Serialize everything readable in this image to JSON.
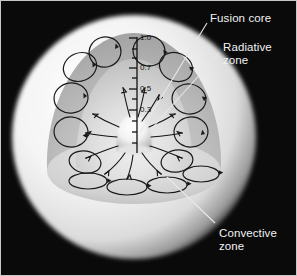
{
  "figure": {
    "background_color": "#0a0a0a",
    "border_color": "#c8c8c8",
    "label_color": "#f2f2f2",
    "leader_color": "#e8e8e8"
  },
  "labels": [
    {
      "id": "fusion-core",
      "text": "Fusion core",
      "x": 209,
      "y": 11
    },
    {
      "id": "radiative-zone",
      "text": "Radiative\nzone",
      "x": 222,
      "y": 40
    },
    {
      "id": "convective-zone",
      "text": "Convective\nzone",
      "x": 218,
      "y": 226
    }
  ],
  "leader_lines": [
    {
      "id": "leader-fusion-core",
      "x1": 206,
      "y1": 22,
      "x2": 139,
      "y2": 131
    },
    {
      "id": "leader-radiative-zone",
      "x1": 218,
      "y1": 52,
      "x2": 152,
      "y2": 126
    },
    {
      "id": "leader-convective-zone",
      "x1": 214,
      "y1": 222,
      "x2": 166,
      "y2": 176
    }
  ],
  "scale": {
    "name": "fractional-solar-radius-scale",
    "axis_x": 136,
    "axis_top_y": 36,
    "axis_bottom_y": 152,
    "unit_note": "fraction of solar radius",
    "ticks": [
      {
        "value": "1.0",
        "y": 37,
        "major": true
      },
      {
        "value": "",
        "y": 48,
        "major": false
      },
      {
        "value": "",
        "y": 57,
        "major": false
      },
      {
        "value": "0.7",
        "y": 67,
        "major": true
      },
      {
        "value": "",
        "y": 77,
        "major": false
      },
      {
        "value": "0.5",
        "y": 88,
        "major": true
      },
      {
        "value": "",
        "y": 98,
        "major": false
      },
      {
        "value": "0.3",
        "y": 109,
        "major": true
      },
      {
        "value": "",
        "y": 120,
        "major": false
      },
      {
        "value": "",
        "y": 131,
        "major": false
      },
      {
        "value": "",
        "y": 142,
        "major": false
      }
    ]
  },
  "regions": [
    {
      "id": "photosphere-sphere",
      "name": "outer solar sphere",
      "color": "#efefef"
    },
    {
      "id": "convective-zone-wedge",
      "name": "convective zone cutaway",
      "color": "#b9b9b9"
    },
    {
      "id": "radiative-zone-wedge",
      "name": "radiative zone cutaway",
      "color": "#d4d4d4"
    },
    {
      "id": "fusion-core-dome",
      "name": "fusion core",
      "color": "#f6f6f6"
    }
  ],
  "convection_cells": {
    "count": 14,
    "stroke": "#1a1a1a",
    "face_wall": [
      {
        "cx": 79,
        "cy": 66,
        "rx": 17,
        "ry": 14,
        "rot": -22
      },
      {
        "cx": 70,
        "cy": 97,
        "rx": 17,
        "ry": 15,
        "rot": -8
      },
      {
        "cx": 70,
        "cy": 131,
        "rx": 17,
        "ry": 15,
        "rot": 6
      },
      {
        "cx": 104,
        "cy": 51,
        "rx": 16,
        "ry": 15,
        "rot": -18
      },
      {
        "cx": 148,
        "cy": 50,
        "rx": 16,
        "ry": 15,
        "rot": 14
      },
      {
        "cx": 175,
        "cy": 66,
        "rx": 17,
        "ry": 14,
        "rot": 24
      },
      {
        "cx": 188,
        "cy": 98,
        "rx": 17,
        "ry": 15,
        "rot": 10
      },
      {
        "cx": 190,
        "cy": 131,
        "rx": 17,
        "ry": 15,
        "rot": -6
      },
      {
        "cx": 176,
        "cy": 160,
        "rx": 16,
        "ry": 11,
        "rot": -10
      },
      {
        "cx": 84,
        "cy": 161,
        "rx": 16,
        "ry": 11,
        "rot": 10
      }
    ],
    "floor_plane": [
      {
        "cx": 87,
        "cy": 180,
        "rx": 19,
        "ry": 8,
        "rot": 0
      },
      {
        "cx": 126,
        "cy": 186,
        "rx": 20,
        "ry": 8,
        "rot": 0
      },
      {
        "cx": 166,
        "cy": 184,
        "rx": 20,
        "ry": 8,
        "rot": 0
      },
      {
        "cx": 200,
        "cy": 173,
        "rx": 18,
        "ry": 8,
        "rot": 0
      }
    ]
  },
  "radiation_arrows": {
    "count": 12,
    "stroke": "#141414",
    "description": "wavy arrows radiating outward from the fusion core through the radiative zone"
  }
}
